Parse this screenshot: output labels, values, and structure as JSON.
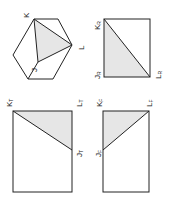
{
  "diagram": {
    "colors": {
      "stroke": "#222222",
      "shade": "#e6e6e6",
      "background": "#ffffff"
    },
    "hexagon": {
      "labels": {
        "K": "K",
        "L": "L",
        "J": "J"
      }
    },
    "rect_R": {
      "labels": {
        "K": "K",
        "K_sub": "R",
        "J": "J",
        "J_sub": "R",
        "L": "L",
        "L_sub": "R"
      }
    },
    "rect_T": {
      "labels": {
        "K": "K",
        "K_sub": "T",
        "L": "L",
        "L_sub": "T",
        "J": "J",
        "J_sub": "T"
      }
    },
    "rect_F": {
      "labels": {
        "K": "K",
        "K_sub": "F",
        "L": "L",
        "L_sub": "F",
        "J": "J",
        "J_sub": "F"
      }
    }
  }
}
